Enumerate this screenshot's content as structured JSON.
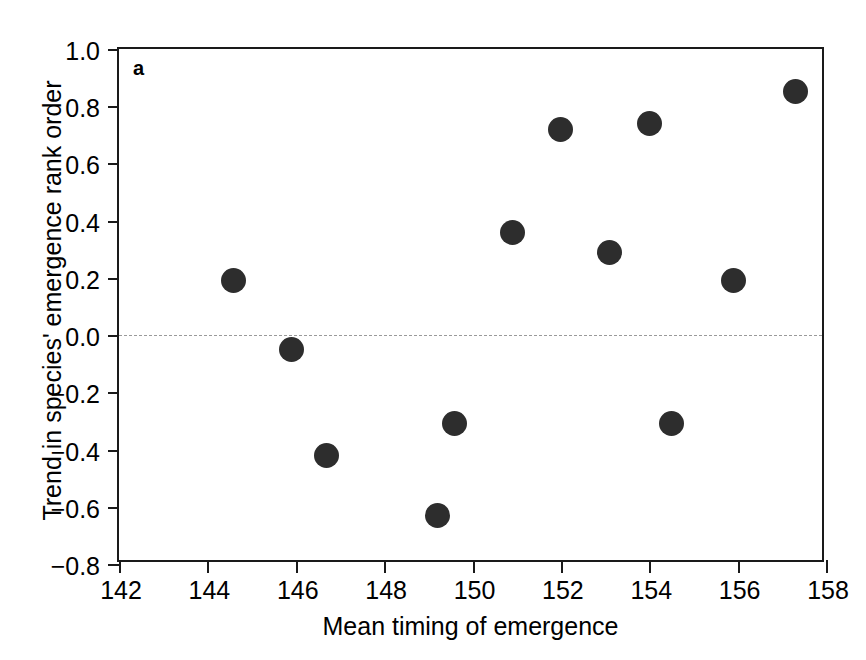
{
  "figure": {
    "panel_label": "a",
    "point_color": "#2d2d2d",
    "axis_color": "#1a1a1a",
    "zero_line_color": "#9a9a9a",
    "background": "#ffffff"
  },
  "chart_data": {
    "type": "scatter",
    "title": "",
    "xlabel": "Mean timing of emergence",
    "ylabel": "Trend in species' emergence rank order",
    "xlim": [
      142,
      158
    ],
    "ylim": [
      -0.8,
      1.0
    ],
    "xticks": [
      142,
      144,
      146,
      148,
      150,
      152,
      154,
      156,
      158
    ],
    "xticklabels": [
      "142",
      "144",
      "146",
      "148",
      "150",
      "152",
      "154",
      "156",
      "158"
    ],
    "yticks": [
      1.0,
      0.8,
      0.6,
      0.4,
      0.2,
      0.0,
      -0.2,
      -0.4,
      -0.6,
      -0.8
    ],
    "yticklabels": [
      "1.0",
      "0.8",
      "0.6",
      "0.4",
      "0.2",
      "0.0",
      "−0.2",
      "−0.4",
      "−0.6",
      "−0.8"
    ],
    "grid": false,
    "legend": null,
    "annotations": [
      {
        "text": "a",
        "position": "top-left-inside"
      }
    ],
    "reference_lines": [
      {
        "orientation": "horizontal",
        "value": 0.0,
        "style": "dashed",
        "color": "#9a9a9a"
      }
    ],
    "points": [
      {
        "x": 144.6,
        "y": 0.19
      },
      {
        "x": 145.9,
        "y": -0.05
      },
      {
        "x": 146.7,
        "y": -0.42
      },
      {
        "x": 149.2,
        "y": -0.63
      },
      {
        "x": 149.6,
        "y": -0.31
      },
      {
        "x": 150.9,
        "y": 0.36
      },
      {
        "x": 152.0,
        "y": 0.72
      },
      {
        "x": 153.1,
        "y": 0.29
      },
      {
        "x": 154.0,
        "y": 0.74
      },
      {
        "x": 154.5,
        "y": -0.31
      },
      {
        "x": 155.9,
        "y": 0.19
      },
      {
        "x": 157.3,
        "y": 0.85
      }
    ]
  }
}
